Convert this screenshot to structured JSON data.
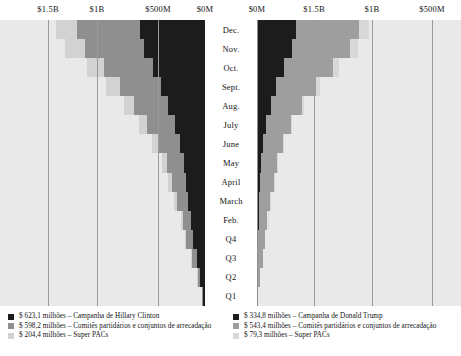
{
  "chart_data": {
    "type": "bar",
    "subtype": "butterfly-diverging-stacked-cumulative",
    "title": "",
    "xlabel": "",
    "ylabel": "",
    "grid": true,
    "legend_position": "bottom",
    "orientation": "horizontal",
    "axes": {
      "left": {
        "label": "Hillary Clinton",
        "direction": "right-to-left",
        "range_usd": [
          0,
          1600000000
        ],
        "ticks": [
          {
            "label": "$1.5B",
            "value": 1500000000,
            "x": 48
          },
          {
            "label": "$1B",
            "value": 1000000000,
            "x": 97
          },
          {
            "label": "$500M",
            "value": 500000000,
            "x": 158
          },
          {
            "label": "$0M",
            "value": 0,
            "x": 205
          }
        ]
      },
      "right": {
        "label": "Donald Trump",
        "direction": "left-to-right",
        "range_usd": [
          0,
          1600000000
        ],
        "ticks": [
          {
            "label": "$0M",
            "value": 0,
            "x": 257
          },
          {
            "label": "$1.5B",
            "value": 500000000,
            "x": 314
          },
          {
            "label": "$1B",
            "value": 1000000000,
            "x": 372
          },
          {
            "label": "$500M",
            "value": 1500000000,
            "x": 432
          }
        ]
      }
    },
    "categories": [
      "Dec.",
      "Nov.",
      "Oct.",
      "Sept.",
      "Aug.",
      "July",
      "June",
      "May",
      "April",
      "March",
      "Feb.",
      "Q4",
      "Q3",
      "Q2",
      "Q1"
    ],
    "series": [
      {
        "name": "Campanha de Hillary Clinton",
        "side": "left",
        "color": "#1c1c1c",
        "total_millions": 623.1,
        "values_millions": [
          623.1,
          583.0,
          498.0,
          420.0,
          353.0,
          290.0,
          238.0,
          204.0,
          182.0,
          159.0,
          130.0,
          112.0,
          78.0,
          48.0,
          19.0
        ]
      },
      {
        "name": "Comitês partidários e conjuntos de arrecadação",
        "side": "left",
        "color": "#8f8f8f",
        "total_millions": 598.2,
        "values_millions": [
          598.2,
          560.0,
          470.0,
          395.0,
          322.0,
          260.0,
          205.0,
          163.0,
          133.0,
          106.0,
          82.0,
          66.0,
          44.0,
          25.0,
          10.0
        ]
      },
      {
        "name": "Super PACs",
        "side": "left",
        "color": "#d2d2d2",
        "total_millions": 204.4,
        "values_millions": [
          204.4,
          190.0,
          157.0,
          128.0,
          101.0,
          80.0,
          62.0,
          47.0,
          37.0,
          28.0,
          21.0,
          16.0,
          10.0,
          5.0,
          2.0
        ]
      },
      {
        "name": "Campanha de Donald Trump",
        "side": "right",
        "color": "#1c1c1c",
        "total_millions": 334.8,
        "values_millions": [
          334.8,
          300.0,
          231.0,
          167.0,
          116.0,
          76.0,
          53.0,
          35.0,
          26.0,
          20.0,
          14.0,
          10.0,
          6.0,
          3.0,
          1.0
        ]
      },
      {
        "name": "Comitês partidários e conjuntos de arrecadação",
        "side": "right",
        "color": "#9e9e9e",
        "total_millions": 543.4,
        "values_millions": [
          543.4,
          500.0,
          420.0,
          338.0,
          268.0,
          214.0,
          172.0,
          140.0,
          116.0,
          95.0,
          76.0,
          62.0,
          43.0,
          25.0,
          9.0
        ]
      },
      {
        "name": "Super PACs",
        "side": "right",
        "color": "#d8d8d8",
        "total_millions": 79.3,
        "values_millions": [
          79.3,
          70.0,
          52.0,
          33.0,
          21.0,
          14.0,
          10.0,
          7.0,
          5.0,
          4.0,
          3.0,
          2.0,
          1.0,
          0.5,
          0.2
        ]
      }
    ]
  },
  "axis_labels": {
    "left": [
      "$1.5B",
      "$1B",
      "$500M",
      "$0M"
    ],
    "right": [
      "$0M",
      "$1.5B",
      "$1B",
      "$500M"
    ]
  },
  "months": [
    "Dec.",
    "Nov.",
    "Oct.",
    "Sept.",
    "Aug.",
    "July",
    "June",
    "May",
    "April",
    "March",
    "Feb.",
    "Q4",
    "Q3",
    "Q2",
    "Q1"
  ],
  "legend": {
    "left": [
      {
        "value": "$ 623,1 milhões",
        "dash": "–",
        "label": "Campanha de Hillary Clinton",
        "color": "#1c1c1c"
      },
      {
        "value": "$ 598,2 milhões",
        "dash": "–",
        "label": "Comitês partidários e conjuntos de arrecadação",
        "color": "#8f8f8f"
      },
      {
        "value": "$ 204,4 milhões",
        "dash": "–",
        "label": "Super PACs",
        "color": "#d2d2d2"
      }
    ],
    "right": [
      {
        "value": "$ 334,8 milhões",
        "dash": "–",
        "label": "Campanha de Donald Trump",
        "color": "#1c1c1c"
      },
      {
        "value": "$ 543,4 milhões",
        "dash": "–",
        "label": "Comitês partidários e conjuntos de arrecadação",
        "color": "#9e9e9e"
      },
      {
        "value": "$  79,3 milhões",
        "dash": "–",
        "label": "Super PACs",
        "color": "#d8d8d8"
      }
    ]
  },
  "colors": {
    "panel_background": "#e9e9e9",
    "gridline": "#9a9a9a",
    "center_column": "#ffffff",
    "text": "#141414"
  }
}
